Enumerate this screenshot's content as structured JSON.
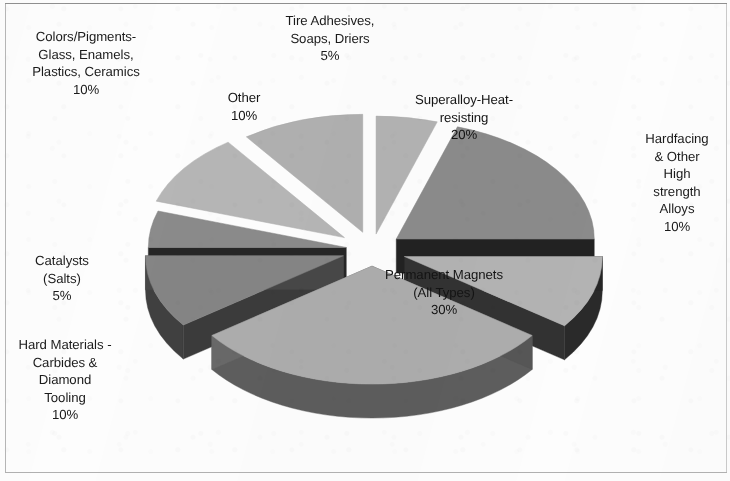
{
  "figure": {
    "kind": "exploded-3d-pie-chart",
    "background_color": "#fdfdfd",
    "border_color": "#9d9d9d",
    "label_text_color": "#1b1b1b"
  },
  "chart_data": {
    "type": "pie",
    "title": "",
    "subtitle": "",
    "xlabel": "",
    "ylabel": "",
    "legend_position": "none",
    "grid": false,
    "exploded": true,
    "three_d": true,
    "start_angle_deg": 0,
    "direction": "clockwise",
    "units": "percent",
    "total": 100,
    "categories": [
      "Tire Adhesives, Soaps, Driers",
      "Superalloy-Heat-resisting",
      "Hardfacing & Other High strength Alloys",
      "Permanent Magnets (All Types)",
      "Hard Materials - Carbides & Diamond Tooling",
      "Catalysts (Salts)",
      "Colors/Pigments-Glass, Enamels, Plastics, Ceramics",
      "Other"
    ],
    "values": [
      5,
      20,
      10,
      30,
      10,
      5,
      10,
      10
    ],
    "value_labels": [
      "5%",
      "20%",
      "10%",
      "30%",
      "10%",
      "5%",
      "10%",
      "10%"
    ],
    "slice_colors": [
      "#b3b3b3",
      "#8b8b8b",
      "#b3b3b3",
      "#adadad",
      "#858585",
      "#8b8b8b",
      "#b6b6b6",
      "#b0b0b0"
    ],
    "slice_side_colors": [
      "#3a3a3a",
      "#1e1e1e",
      "#2b2b2b",
      "#5d5d5d",
      "#3f3f3f",
      "#2c2c2c",
      "#343434",
      "#2e2e2e"
    ]
  },
  "labels": [
    {
      "id": "tire-adhesives",
      "name": "Tire Adhesives,\nSoaps, Driers",
      "percent": "5%",
      "text": "Tire Adhesives,\nSoaps, Driers\n5%",
      "placement": "outside-top"
    },
    {
      "id": "superalloy",
      "name": "Superalloy-Heat-\nresisting",
      "percent": "20%",
      "text": "Superalloy-Heat-\nresisting\n20%",
      "placement": "inside"
    },
    {
      "id": "hardfacing",
      "name": "Hardfacing\n& Other\nHigh\nstrength\nAlloys",
      "percent": "10%",
      "text": "Hardfacing\n& Other\nHigh\nstrength\nAlloys\n10%",
      "placement": "outside-right"
    },
    {
      "id": "permanent-magnets",
      "name": "Permanent Magnets\n(All Types)",
      "percent": "30%",
      "text": "Permanent Magnets\n(All Types)\n30%",
      "placement": "inside"
    },
    {
      "id": "hard-materials",
      "name": "Hard Materials -\nCarbides &\nDiamond\nTooling",
      "percent": "10%",
      "text": "Hard Materials -\nCarbides &\nDiamond\nTooling\n10%",
      "placement": "outside-left"
    },
    {
      "id": "catalysts",
      "name": "Catalysts\n(Salts)",
      "percent": "5%",
      "text": "Catalysts\n(Salts)\n5%",
      "placement": "outside-left"
    },
    {
      "id": "colors-pigments",
      "name": "Colors/Pigments-\nGlass, Enamels,\nPlastics, Ceramics",
      "percent": "10%",
      "text": "Colors/Pigments-\nGlass, Enamels,\nPlastics, Ceramics\n10%",
      "placement": "outside-top-left"
    },
    {
      "id": "other",
      "name": "Other",
      "percent": "10%",
      "text": "Other\n10%",
      "placement": "inside"
    }
  ]
}
